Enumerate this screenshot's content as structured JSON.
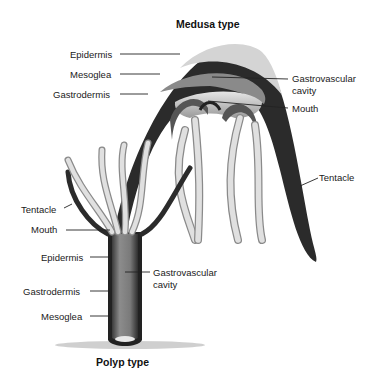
{
  "diagram": {
    "medusa": {
      "title": "Medusa type",
      "labels": {
        "epidermis": "Epidermis",
        "mesoglea": "Mesoglea",
        "gastrodermis": "Gastrodermis",
        "gastrovascular_cavity_1": "Gastrovascular",
        "gastrovascular_cavity_2": "cavity",
        "mouth": "Mouth",
        "tentacle": "Tentacle"
      }
    },
    "polyp": {
      "title": "Polyp type",
      "labels": {
        "tentacle": "Tentacle",
        "mouth": "Mouth",
        "epidermis": "Epidermis",
        "gastrovascular_cavity_1": "Gastrovascular",
        "gastrovascular_cavity_2": "cavity",
        "gastrodermis": "Gastrodermis",
        "mesoglea": "Mesoglea"
      }
    },
    "colors": {
      "outer_layer": "#2a2a2a",
      "mid_layer": "#6a6a6a",
      "cavity": "#bdbdbd",
      "tentacle_fill": "#dedede",
      "tentacle_edge": "#8a8a8a",
      "leader_line": "#222222"
    }
  }
}
